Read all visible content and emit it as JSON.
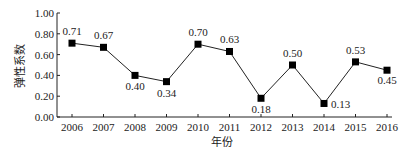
{
  "chart_data": {
    "type": "line",
    "title": "",
    "xlabel": "年份",
    "ylabel": "弹性系数",
    "categories": [
      "2006",
      "2007",
      "2008",
      "2009",
      "2010",
      "2011",
      "2012",
      "2013",
      "2014",
      "2015",
      "2016"
    ],
    "series": [
      {
        "name": "弹性系数",
        "values": [
          0.71,
          0.67,
          0.4,
          0.34,
          0.7,
          0.63,
          0.18,
          0.5,
          0.13,
          0.53,
          0.45
        ],
        "labels": [
          "0.71",
          "0.67",
          "0.40",
          "0.34",
          "0.70",
          "0.63",
          "0.18",
          "0.50",
          "0.13",
          "0.53",
          "0.45"
        ],
        "marker": "square",
        "color": "#000000"
      }
    ],
    "ylim": [
      0,
      1.0
    ],
    "yticks": [
      "0.00",
      "0.20",
      "0.40",
      "0.60",
      "0.80",
      "1.00"
    ],
    "grid": false,
    "legend": "none"
  }
}
